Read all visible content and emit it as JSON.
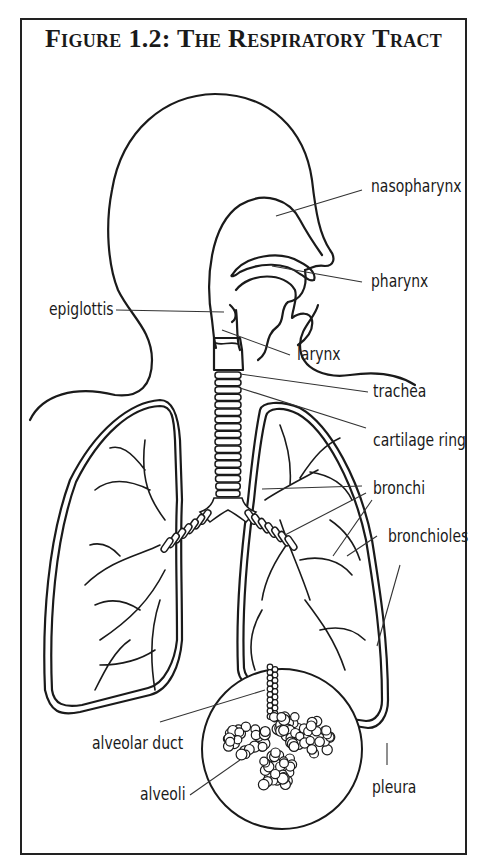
{
  "figure": {
    "title": "Figure 1.2: The Respiratory Tract"
  },
  "labels": {
    "nasopharynx": "nasopharynx",
    "pharynx": "pharynx",
    "epiglottis": "epiglottis",
    "larynx": "larynx",
    "trachea": "trachea",
    "cartilage_ring": "cartilage ring",
    "bronchi": "bronchi",
    "bronchioles": "bronchioles",
    "alveolar_duct": "alveolar duct",
    "alveoli": "alveoli",
    "pleura": "pleura"
  },
  "colors": {
    "line": "#1a1a1a",
    "background": "#ffffff"
  }
}
